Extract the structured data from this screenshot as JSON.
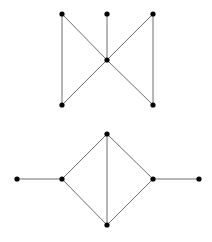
{
  "colors": {
    "edge": "#6e6e6e",
    "node": "#000000",
    "background": "#ffffff"
  },
  "graphs": [
    {
      "name": "graph-top",
      "nodes": [
        {
          "id": "a",
          "x": 62,
          "y": 14
        },
        {
          "id": "b",
          "x": 107,
          "y": 14
        },
        {
          "id": "c",
          "x": 153,
          "y": 14
        },
        {
          "id": "d",
          "x": 107,
          "y": 60
        },
        {
          "id": "e",
          "x": 62,
          "y": 105
        },
        {
          "id": "f",
          "x": 153,
          "y": 105
        }
      ],
      "edges": [
        [
          "a",
          "e"
        ],
        [
          "a",
          "d"
        ],
        [
          "b",
          "d"
        ],
        [
          "c",
          "d"
        ],
        [
          "c",
          "f"
        ],
        [
          "d",
          "e"
        ],
        [
          "d",
          "f"
        ]
      ]
    },
    {
      "name": "graph-bottom",
      "nodes": [
        {
          "id": "p",
          "x": 17,
          "y": 179
        },
        {
          "id": "q",
          "x": 62,
          "y": 179
        },
        {
          "id": "r",
          "x": 107,
          "y": 134
        },
        {
          "id": "s",
          "x": 107,
          "y": 225
        },
        {
          "id": "t",
          "x": 153,
          "y": 179
        },
        {
          "id": "u",
          "x": 199,
          "y": 179
        }
      ],
      "edges": [
        [
          "p",
          "q"
        ],
        [
          "q",
          "r"
        ],
        [
          "q",
          "s"
        ],
        [
          "r",
          "s"
        ],
        [
          "r",
          "t"
        ],
        [
          "s",
          "t"
        ],
        [
          "t",
          "u"
        ]
      ]
    }
  ]
}
